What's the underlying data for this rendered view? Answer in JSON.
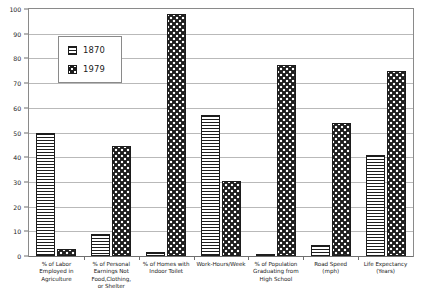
{
  "chart_data": {
    "type": "bar",
    "title": "",
    "subtitle": "",
    "xlabel": "",
    "ylabel": "",
    "ylim": [
      0,
      100
    ],
    "yticks": [
      0,
      10,
      20,
      30,
      40,
      50,
      60,
      70,
      80,
      90,
      100
    ],
    "grid": true,
    "legend_position": "upper-left-inside",
    "categories": [
      "% of Labor Employed in Agriculture",
      "% of Personal Earnings Not Food, Clothing, or Shelter",
      "% of Homes with Indoor Toilet",
      "Work-Hours/Week",
      "% of Population Graduating from High School",
      "Road Speed (mph)",
      "Life Expectancy (Years)"
    ],
    "category_lines": [
      [
        "% of Labor",
        "Employed in",
        "Agriculture"
      ],
      [
        "% of Personal",
        "Earnings Not",
        "Food,Clothing,",
        "or Shelter"
      ],
      [
        "% of Homes with",
        "Indoor Toilet"
      ],
      [
        "Work-Hours/Week"
      ],
      [
        "% of Population",
        "Graduating from",
        "High School"
      ],
      [
        "Road Speed",
        "(mph)"
      ],
      [
        "Life Expectancy",
        "(Years)"
      ]
    ],
    "series": [
      {
        "name": "1870",
        "pattern": "horizontal-lines",
        "values": [
          50,
          9,
          1.5,
          57,
          1,
          4.5,
          41
        ]
      },
      {
        "name": "1979",
        "pattern": "checkerboard-dots",
        "values": [
          3,
          44.5,
          98,
          30.5,
          77.5,
          54,
          75
        ]
      }
    ]
  },
  "legend": {
    "items": [
      {
        "label": "1870"
      },
      {
        "label": "1979"
      }
    ]
  },
  "colors": {
    "ink": "#1d1d1d",
    "grid": "#b9b9b9",
    "axis": "#6f6f6f",
    "background": "#ffffff"
  }
}
